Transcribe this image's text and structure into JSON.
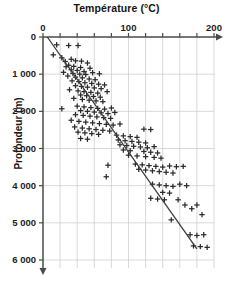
{
  "chart_data": {
    "type": "scatter",
    "title": "Température (°C)",
    "xlabel": "Température (°C)",
    "ylabel": "Profondeur (m)",
    "xlim": [
      0,
      200
    ],
    "ylim": [
      0,
      6000
    ],
    "y_axis_inverted": true,
    "grid": true,
    "legend": "none",
    "x_ticks": [
      0,
      20,
      40,
      60,
      80,
      100,
      120,
      140,
      160,
      180,
      200
    ],
    "x_tick_labels": [
      "0",
      "100",
      "200"
    ],
    "x_labeled_values": [
      0,
      100,
      200
    ],
    "y_ticks": [
      0,
      1000,
      2000,
      3000,
      4000,
      5000,
      6000
    ],
    "y_tick_labels": [
      "0",
      "1 000",
      "2 000",
      "3 000",
      "4 000",
      "5 000",
      "6 000"
    ],
    "marker": "plus",
    "marker_color": "#2b2b2b",
    "grid_color": "#c9c9c9",
    "axis_color": "#4a4a4a",
    "trendline": {
      "label": "gradient géothermique moyen",
      "color": "#3a3a3a",
      "x_start": 5,
      "y_start": 0,
      "x_end": 180,
      "y_end": 5700
    },
    "series": [
      {
        "name": "forages",
        "points": [
          [
            16,
            210
          ],
          [
            30,
            230
          ],
          [
            41,
            230
          ],
          [
            12,
            480
          ],
          [
            22,
            560
          ],
          [
            33,
            600
          ],
          [
            26,
            660
          ],
          [
            38,
            640
          ],
          [
            45,
            650
          ],
          [
            52,
            700
          ],
          [
            30,
            760
          ],
          [
            36,
            790
          ],
          [
            27,
            800
          ],
          [
            44,
            820
          ],
          [
            55,
            840
          ],
          [
            33,
            880
          ],
          [
            40,
            900
          ],
          [
            48,
            930
          ],
          [
            24,
            950
          ],
          [
            58,
            960
          ],
          [
            35,
            980
          ],
          [
            66,
            990
          ],
          [
            43,
            1000
          ],
          [
            50,
            1010
          ],
          [
            29,
            1050
          ],
          [
            38,
            1080
          ],
          [
            46,
            1100
          ],
          [
            54,
            1130
          ],
          [
            61,
            1150
          ],
          [
            34,
            1180
          ],
          [
            42,
            1200
          ],
          [
            49,
            1230
          ],
          [
            57,
            1250
          ],
          [
            65,
            1270
          ],
          [
            72,
            1290
          ],
          [
            38,
            1310
          ],
          [
            45,
            1330
          ],
          [
            52,
            1350
          ],
          [
            60,
            1370
          ],
          [
            68,
            1390
          ],
          [
            31,
            1420
          ],
          [
            41,
            1450
          ],
          [
            48,
            1470
          ],
          [
            56,
            1490
          ],
          [
            64,
            1510
          ],
          [
            75,
            1470
          ],
          [
            44,
            1560
          ],
          [
            51,
            1580
          ],
          [
            59,
            1600
          ],
          [
            67,
            1620
          ],
          [
            36,
            1650
          ],
          [
            46,
            1680
          ],
          [
            54,
            1700
          ],
          [
            62,
            1720
          ],
          [
            70,
            1740
          ],
          [
            22,
            1930
          ],
          [
            40,
            1860
          ],
          [
            48,
            1880
          ],
          [
            56,
            1900
          ],
          [
            64,
            1920
          ],
          [
            72,
            1940
          ],
          [
            80,
            1910
          ],
          [
            44,
            1980
          ],
          [
            52,
            2000
          ],
          [
            60,
            2020
          ],
          [
            68,
            2040
          ],
          [
            76,
            2060
          ],
          [
            84,
            2030
          ],
          [
            38,
            2090
          ],
          [
            47,
            2110
          ],
          [
            55,
            2130
          ],
          [
            63,
            2150
          ],
          [
            71,
            2170
          ],
          [
            79,
            2190
          ],
          [
            33,
            2240
          ],
          [
            42,
            2270
          ],
          [
            50,
            2290
          ],
          [
            58,
            2310
          ],
          [
            66,
            2330
          ],
          [
            74,
            2350
          ],
          [
            82,
            2370
          ],
          [
            90,
            2340
          ],
          [
            37,
            2420
          ],
          [
            46,
            2450
          ],
          [
            54,
            2470
          ],
          [
            62,
            2490
          ],
          [
            70,
            2510
          ],
          [
            78,
            2530
          ],
          [
            118,
            2480
          ],
          [
            126,
            2490
          ],
          [
            41,
            2560
          ],
          [
            49,
            2580
          ],
          [
            57,
            2600
          ],
          [
            65,
            2620
          ],
          [
            86,
            2640
          ],
          [
            94,
            2660
          ],
          [
            102,
            2680
          ],
          [
            110,
            2700
          ],
          [
            44,
            2730
          ],
          [
            52,
            2750
          ],
          [
            88,
            2770
          ],
          [
            96,
            2790
          ],
          [
            104,
            2810
          ],
          [
            112,
            2830
          ],
          [
            120,
            2850
          ],
          [
            90,
            2900
          ],
          [
            98,
            2920
          ],
          [
            106,
            2940
          ],
          [
            114,
            2960
          ],
          [
            122,
            2980
          ],
          [
            130,
            2950
          ],
          [
            94,
            3040
          ],
          [
            102,
            3060
          ],
          [
            118,
            3080
          ],
          [
            126,
            3100
          ],
          [
            134,
            3120
          ],
          [
            100,
            3180
          ],
          [
            110,
            3200
          ],
          [
            120,
            3220
          ],
          [
            130,
            3240
          ],
          [
            138,
            3260
          ],
          [
            76,
            3450
          ],
          [
            108,
            3420
          ],
          [
            116,
            3440
          ],
          [
            124,
            3460
          ],
          [
            132,
            3480
          ],
          [
            140,
            3500
          ],
          [
            148,
            3470
          ],
          [
            156,
            3490
          ],
          [
            164,
            3480
          ],
          [
            74,
            3760
          ],
          [
            112,
            3560
          ],
          [
            120,
            3580
          ],
          [
            128,
            3600
          ],
          [
            136,
            3620
          ],
          [
            144,
            3640
          ],
          [
            152,
            3660
          ],
          [
            128,
            3960
          ],
          [
            136,
            3980
          ],
          [
            144,
            4000
          ],
          [
            152,
            4020
          ],
          [
            160,
            3960
          ],
          [
            168,
            4000
          ],
          [
            140,
            4180
          ],
          [
            148,
            4200
          ],
          [
            126,
            4340
          ],
          [
            134,
            4360
          ],
          [
            142,
            4380
          ],
          [
            158,
            4380
          ],
          [
            166,
            4520
          ],
          [
            174,
            4620
          ],
          [
            180,
            4520
          ],
          [
            150,
            4920
          ],
          [
            186,
            4780
          ],
          [
            172,
            5320
          ],
          [
            180,
            5340
          ],
          [
            188,
            5320
          ],
          [
            176,
            5620
          ],
          [
            184,
            5640
          ],
          [
            192,
            5660
          ]
        ]
      }
    ]
  }
}
